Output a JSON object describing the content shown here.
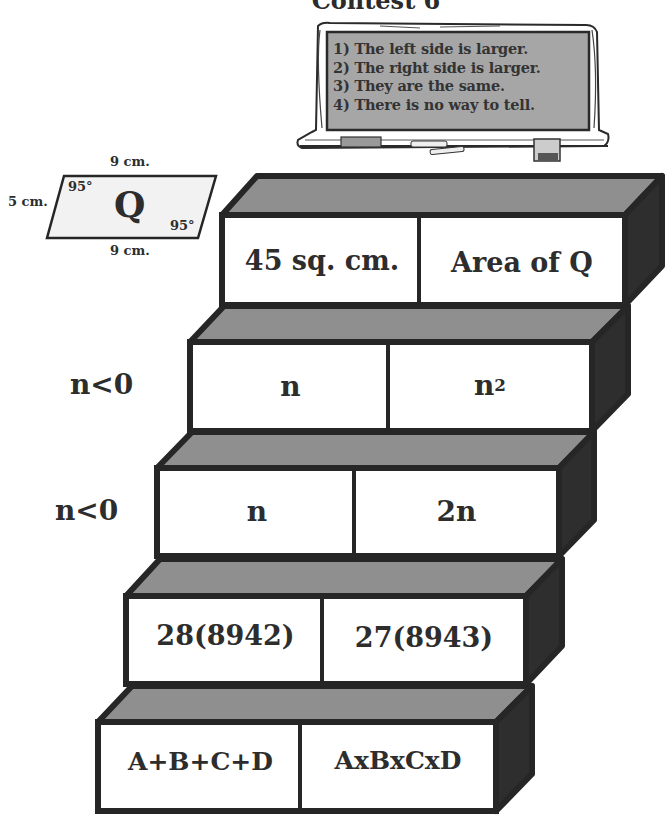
{
  "title": "Contest 6",
  "chalkboard": {
    "options": [
      "1) The left side is larger.",
      "2) The right side is larger.",
      "3) They are the same.",
      "4) There is no way to tell."
    ]
  },
  "parallelogram": {
    "name": "Q",
    "top_side": "9 cm.",
    "bottom_side": "9 cm.",
    "left_side": "5 cm.",
    "angle_top_left": "95°",
    "angle_bottom_right": "95°"
  },
  "comparisons": [
    {
      "condition": "",
      "left": "45 sq. cm.",
      "right": "Area of Q"
    },
    {
      "condition": "n<0",
      "left": "n",
      "right_base": "n",
      "right_exp": "2"
    },
    {
      "condition": "n<0",
      "left": "n",
      "right": "2n"
    },
    {
      "condition": "",
      "left": "28(8942)",
      "right": "27(8943)"
    },
    {
      "condition": "",
      "left": "A+B+C+D",
      "right": "AxBxCxD"
    }
  ],
  "colors": {
    "outline": "#262626",
    "top_face": "#8f8f8f",
    "side_face": "#2e2e2e",
    "front_face": "#ffffff",
    "chalkboard": "#a6a6a6",
    "parallelogram_fill": "#f2f2f2"
  }
}
